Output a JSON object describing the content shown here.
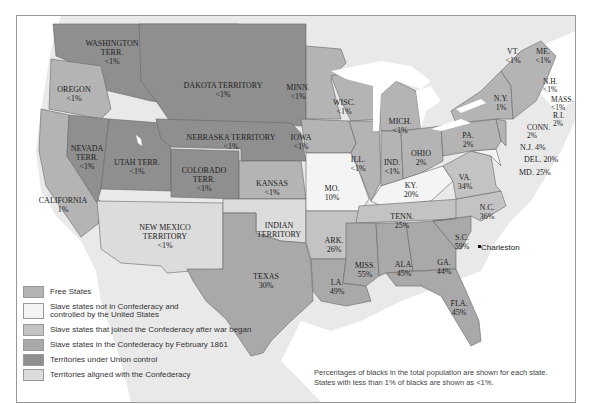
{
  "map": {
    "note_lines": [
      "Percentages of blacks in the total population are shown for each state.",
      "States with less than 1% of blacks are shown as <1%."
    ],
    "city": {
      "name": "Charleston"
    },
    "colors": {
      "free": "#b4b4b4",
      "border_union": "#f4f4f4",
      "joined_after": "#c3c3c3",
      "confederacy_1861": "#a9a9a9",
      "union_territory": "#8f8f8f",
      "confederate_territory": "#dcdcdc",
      "water": "#ffffff",
      "land_bg": "#e9e9e9"
    },
    "legend": [
      {
        "label": "Free States",
        "color": "#b4b4b4"
      },
      {
        "label": "Slave states not in Confederacy and controlled by the United States",
        "line1": "Slave states not in Confederacy and",
        "line2": "controlled by the United States",
        "color": "#f4f4f4"
      },
      {
        "label": "Slave states that joined the Confederacy after war began",
        "color": "#c3c3c3"
      },
      {
        "label": "Slave states in the Confederacy by February 1861",
        "color": "#a9a9a9"
      },
      {
        "label": "Territories under Union control",
        "color": "#8f8f8f"
      },
      {
        "label": "Territories aligned with the Confederacy",
        "color": "#dcdcdc"
      }
    ],
    "regions": [
      {
        "name": "WASHINGTON TERR.",
        "n1": "WASHINGTON",
        "n2": "TERR.",
        "pct": "<1%",
        "category": "Territories under Union control"
      },
      {
        "name": "OREGON",
        "pct": "<1%",
        "category": "Free States"
      },
      {
        "name": "CALIFORNIA",
        "pct": "1%",
        "category": "Free States"
      },
      {
        "name": "NEVADA TERR.",
        "n1": "NEVADA",
        "n2": "TERR.",
        "pct": "<1%",
        "category": "Territories under Union control"
      },
      {
        "name": "UTAH TERR.",
        "pct": "<1%",
        "category": "Territories under Union control"
      },
      {
        "name": "DAKOTA TERRITORY",
        "pct": "<1%",
        "category": "Territories under Union control"
      },
      {
        "name": "NEBRASKA TERRITORY",
        "pct": "<1%",
        "category": "Territories under Union control"
      },
      {
        "name": "COLORADO TERR.",
        "n1": "COLORADO",
        "n2": "TERR.",
        "pct": "<1%",
        "category": "Territories under Union control"
      },
      {
        "name": "KANSAS",
        "pct": "<1%",
        "category": "Free States"
      },
      {
        "name": "NEW MEXICO TERRITORY",
        "n1": "NEW MEXICO",
        "n2": "TERRITORY",
        "pct": "<1%",
        "category": "Territories aligned with the Confederacy"
      },
      {
        "name": "INDIAN TERRITORY",
        "n1": "INDIAN",
        "n2": "TERRITORY",
        "pct": "",
        "category": "Territories aligned with the Confederacy"
      },
      {
        "name": "TEXAS",
        "pct": "30%",
        "category": "Slave states in the Confederacy by February 1861"
      },
      {
        "name": "MINN.",
        "pct": "<1%",
        "category": "Free States"
      },
      {
        "name": "IOWA",
        "pct": "<1%",
        "category": "Free States"
      },
      {
        "name": "MO.",
        "pct": "10%",
        "category": "Slave states not in Confederacy"
      },
      {
        "name": "ARK.",
        "pct": "26%",
        "category": "Slave states that joined the Confederacy after war began"
      },
      {
        "name": "LA.",
        "pct": "49%",
        "category": "Slave states in the Confederacy by February 1861"
      },
      {
        "name": "WISC.",
        "pct": "<1%",
        "category": "Free States"
      },
      {
        "name": "ILL.",
        "pct": "<1%",
        "category": "Free States"
      },
      {
        "name": "MICH.",
        "pct": "<1%",
        "category": "Free States"
      },
      {
        "name": "IND.",
        "pct": "<1%",
        "category": "Free States"
      },
      {
        "name": "OHIO",
        "pct": "2%",
        "category": "Free States"
      },
      {
        "name": "KY.",
        "pct": "20%",
        "category": "Slave states not in Confederacy"
      },
      {
        "name": "TENN.",
        "pct": "25%",
        "category": "Slave states that joined the Confederacy after war began"
      },
      {
        "name": "MISS.",
        "pct": "55%",
        "category": "Slave states in the Confederacy by February 1861"
      },
      {
        "name": "ALA.",
        "pct": "45%",
        "category": "Slave states in the Confederacy by February 1861"
      },
      {
        "name": "GA.",
        "pct": "44%",
        "category": "Slave states in the Confederacy by February 1861"
      },
      {
        "name": "FLA.",
        "pct": "45%",
        "category": "Slave states in the Confederacy by February 1861"
      },
      {
        "name": "S.C.",
        "pct": "59%",
        "category": "Slave states in the Confederacy by February 1861"
      },
      {
        "name": "N.C.",
        "pct": "36%",
        "category": "Slave states that joined the Confederacy after war began"
      },
      {
        "name": "VA.",
        "pct": "34%",
        "category": "Slave states that joined the Confederacy after war began"
      },
      {
        "name": "PA.",
        "pct": "2%",
        "category": "Free States"
      },
      {
        "name": "N.Y.",
        "pct": "1%",
        "category": "Free States"
      },
      {
        "name": "VT.",
        "pct": "<1%",
        "category": "Free States"
      },
      {
        "name": "ME.",
        "pct": "<1%",
        "category": "Free States"
      },
      {
        "name": "N.H.",
        "pct": "<1%",
        "category": "Free States"
      },
      {
        "name": "MASS.",
        "pct": "<1%",
        "category": "Free States"
      },
      {
        "name": "R.I.",
        "pct": "2%",
        "category": "Free States"
      },
      {
        "name": "CONN.",
        "pct": "2%",
        "category": "Free States"
      },
      {
        "name": "N.J.",
        "pct": "4%",
        "label": "N.J. 4%",
        "category": "Free States"
      },
      {
        "name": "DEL.",
        "pct": "20%",
        "label": "DEL. 20%",
        "category": "Slave states not in Confederacy"
      },
      {
        "name": "MD.",
        "pct": "25%",
        "label": "MD. 25%",
        "category": "Slave states not in Confederacy"
      }
    ]
  }
}
